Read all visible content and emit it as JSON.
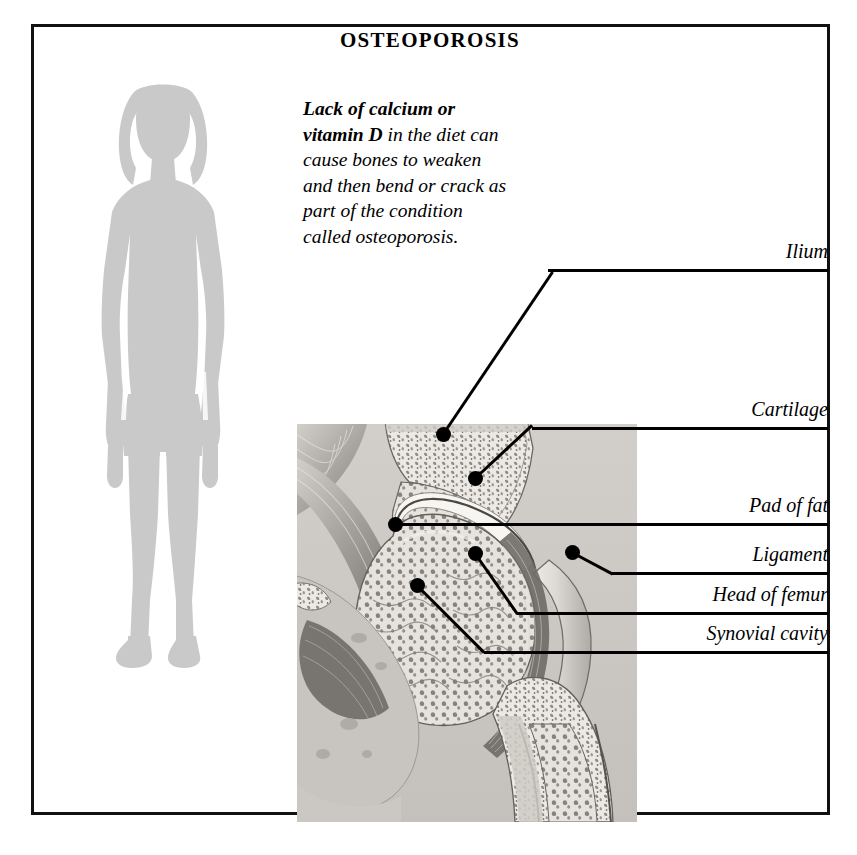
{
  "document": {
    "title": "OSTEOPOROSIS",
    "body_bold_lead": "Lack of calcium or vitamin D",
    "body_rest": " in the diet can cause bones to weaken and then bend or crack as part of the condition called osteoporosis.",
    "body_full": "Lack of calcium or vitamin D in the diet can cause bones to weaken and then bend or crack as part of the condition called osteoporosis."
  },
  "illustration": {
    "subject": "hip-joint-cross-section",
    "silhouette": "standing-human-figure-silhouette"
  },
  "labels": [
    {
      "id": "ilium",
      "text": "Ilium"
    },
    {
      "id": "cartilage",
      "text": "Cartilage"
    },
    {
      "id": "pad-of-fat",
      "text": "Pad of fat"
    },
    {
      "id": "ligament",
      "text": "Ligament"
    },
    {
      "id": "head-of-femur",
      "text": "Head of femur"
    },
    {
      "id": "synovial-cavity",
      "text": "Synovial cavity"
    }
  ],
  "colors": {
    "ink": "#111111",
    "silhouette": "#c9c9c9",
    "bone_light": "#e8e6e2",
    "bone_mid": "#b9b6b1",
    "bone_dark": "#6f6c68",
    "background": "#ffffff"
  }
}
